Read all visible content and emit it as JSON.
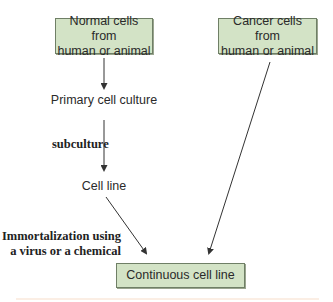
{
  "diagram": {
    "nodes": {
      "normal_cells": "Normal cells from human or animal",
      "normal_cells_line1": "Normal cells from",
      "normal_cells_line2": "human or animal",
      "cancer_cells_line1": "Cancer cells from",
      "cancer_cells_line2": "human or animal",
      "primary_culture": "Primary cell culture",
      "cell_line": "Cell line",
      "continuous_cell_line": "Continuous cell line"
    },
    "edge_labels": {
      "subculture": "subculture",
      "immortalization_line1": "Immortalization using",
      "immortalization_line2": "a virus or a chemical"
    },
    "edges": [
      {
        "from": "Normal cells from human or animal",
        "to": "Primary cell culture"
      },
      {
        "from": "Primary cell culture",
        "to": "Cell line",
        "label": "subculture"
      },
      {
        "from": "Cell line",
        "to": "Continuous cell line",
        "label": "Immortalization using a virus or a chemical"
      },
      {
        "from": "Cancer cells from human or animal",
        "to": "Continuous cell line"
      }
    ],
    "colors": {
      "box_fill": "#d3e3c6",
      "box_border": "#6f7f66",
      "arrow": "#333333",
      "text": "#2a2a2a"
    }
  }
}
